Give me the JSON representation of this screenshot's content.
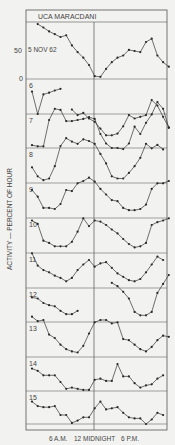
{
  "chart_data": {
    "type": "line",
    "title": "UCA  MARACDANI",
    "date_label": "5 NOV 62",
    "ylabel": "ACTIVITY — PERCENT OF HOUR",
    "xlabel": "",
    "x_tick_labels": [
      "6 A.M.",
      "12 MIDNIGHT",
      "6 P.M."
    ],
    "y_tick_labels": [
      "50",
      "0"
    ],
    "ylim": [
      0,
      100
    ],
    "grid": true,
    "hours": 24,
    "series": [
      {
        "name": "5",
        "values": [
          null,
          98,
          92,
          85,
          80,
          75,
          78,
          60,
          48,
          38,
          25,
          5,
          4,
          18,
          30,
          38,
          42,
          52,
          50,
          48,
          66,
          72,
          42,
          30,
          22
        ]
      },
      {
        "name": "6",
        "values": [
          40,
          0,
          35,
          38,
          42,
          45,
          null,
          8,
          -2,
          2,
          -8,
          -14,
          -26,
          -38,
          -38,
          -35,
          -22,
          -2,
          -8,
          -5,
          -2,
          25,
          15,
          -5,
          -24
        ]
      },
      {
        "name": "7",
        "values": [
          5,
          3,
          3,
          50,
          70,
          68,
          48,
          48,
          50,
          52,
          55,
          52,
          25,
          8,
          0,
          0,
          -2,
          8,
          38,
          25,
          45,
          60,
          82,
          70,
          36
        ]
      },
      {
        "name": "8",
        "values": [
          28,
          12,
          5,
          8,
          30,
          66,
          80,
          74,
          70,
          78,
          75,
          70,
          52,
          35,
          12,
          8,
          8,
          18,
          30,
          45,
          70,
          62,
          68,
          60,
          null
        ]
      },
      {
        "name": "9",
        "values": [
          50,
          38,
          18,
          18,
          16,
          25,
          50,
          48,
          62,
          66,
          72,
          65,
          52,
          42,
          32,
          30,
          18,
          14,
          14,
          16,
          24,
          52,
          62,
          62,
          66
        ]
      },
      {
        "name": "10",
        "values": [
          58,
          52,
          22,
          18,
          12,
          12,
          12,
          20,
          38,
          62,
          48,
          58,
          56,
          50,
          42,
          35,
          25,
          16,
          10,
          12,
          18,
          50,
          55,
          58,
          62
        ]
      },
      {
        "name": "11",
        "values": [
          62,
          40,
          32,
          28,
          22,
          18,
          12,
          18,
          32,
          42,
          50,
          38,
          44,
          46,
          36,
          26,
          20,
          14,
          12,
          16,
          28,
          42,
          56,
          50,
          null
        ]
      },
      {
        "name": "12",
        "values": [
          44,
          42,
          34,
          30,
          28,
          20,
          14,
          14,
          20,
          null,
          null,
          null,
          null,
          null,
          70,
          64,
          54,
          42,
          18,
          12,
          12,
          18,
          52,
          68,
          84
        ]
      },
      {
        "name": "13",
        "values": [
          72,
          64,
          66,
          40,
          34,
          22,
          14,
          10,
          8,
          20,
          42,
          62,
          66,
          66,
          60,
          62,
          32,
          30,
          22,
          14,
          10,
          18,
          30,
          38,
          36
        ]
      },
      {
        "name": "14",
        "values": [
          40,
          36,
          28,
          28,
          28,
          16,
          4,
          6,
          4,
          2,
          2,
          20,
          22,
          18,
          18,
          48,
          26,
          26,
          14,
          6,
          10,
          12,
          22,
          28,
          null
        ]
      },
      {
        "name": "15",
        "values": [
          40,
          32,
          30,
          30,
          32,
          16,
          16,
          2,
          6,
          12,
          12,
          28,
          40,
          26,
          28,
          30,
          20,
          12,
          10,
          10,
          0,
          8,
          20,
          16,
          null
        ]
      }
    ]
  }
}
